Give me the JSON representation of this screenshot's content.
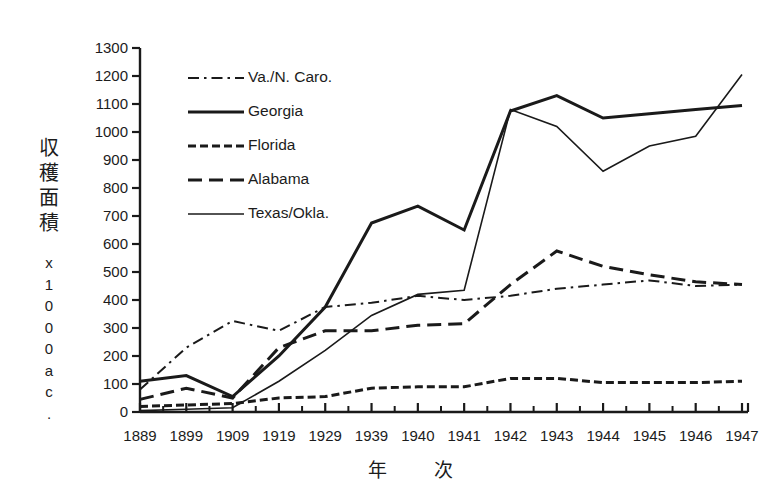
{
  "chart_data": {
    "type": "line",
    "title": "",
    "xlabel": "年　次",
    "ylabel": "収穫面積",
    "ylabel_unit": "x 1000 ac.",
    "ylabel_unit_chars": [
      "x",
      "1",
      "0",
      "0",
      "0",
      "a",
      "c",
      "."
    ],
    "ylabel_chars": [
      "収",
      "穫",
      "面",
      "積"
    ],
    "grid": false,
    "legend_position": "upper-left-inside",
    "categories": [
      "1889",
      "1899",
      "1909",
      "1919",
      "1929",
      "1939",
      "1940",
      "1941",
      "1942",
      "1943",
      "1944",
      "1945",
      "1946",
      "1947"
    ],
    "xlim": [
      0,
      13
    ],
    "ylim": [
      0,
      1300
    ],
    "ytick_labels": [
      "0",
      "100",
      "200",
      "300",
      "400",
      "500",
      "600",
      "700",
      "800",
      "900",
      "1000",
      "1100",
      "1200",
      "1300"
    ],
    "ytick_values": [
      0,
      100,
      200,
      300,
      400,
      500,
      600,
      700,
      800,
      900,
      1000,
      1100,
      1200,
      1300
    ],
    "series": [
      {
        "name": "Va./N. Caro.",
        "style": "dash-dot",
        "width": 2,
        "color": "#1a1a1a",
        "values": [
          80,
          230,
          325,
          290,
          375,
          390,
          415,
          400,
          415,
          440,
          455,
          470,
          450,
          455
        ]
      },
      {
        "name": "Georgia",
        "style": "solid-thick",
        "width": 3,
        "color": "#1a1a1a",
        "values": [
          110,
          130,
          55,
          200,
          375,
          675,
          735,
          650,
          1075,
          1130,
          1050,
          1065,
          1080,
          1095
        ]
      },
      {
        "name": "Florida",
        "style": "dotted-dash",
        "width": 3,
        "color": "#1a1a1a",
        "values": [
          20,
          25,
          30,
          50,
          55,
          85,
          90,
          90,
          120,
          120,
          105,
          105,
          105,
          110
        ]
      },
      {
        "name": "Alabama",
        "style": "dashed-long",
        "width": 3,
        "color": "#1a1a1a",
        "values": [
          45,
          85,
          50,
          230,
          290,
          290,
          310,
          315,
          455,
          575,
          520,
          490,
          465,
          455
        ]
      },
      {
        "name": "Texas/Okla.",
        "style": "solid-thin",
        "width": 1.6,
        "color": "#1a1a1a",
        "values": [
          5,
          10,
          15,
          110,
          220,
          345,
          420,
          435,
          1080,
          1020,
          860,
          950,
          985,
          1205
        ]
      }
    ]
  },
  "legend": {
    "items": [
      {
        "label": "Va./N. Caro."
      },
      {
        "label": "Georgia"
      },
      {
        "label": "Florida"
      },
      {
        "label": "Alabama"
      },
      {
        "label": "Texas/Okla."
      }
    ]
  }
}
